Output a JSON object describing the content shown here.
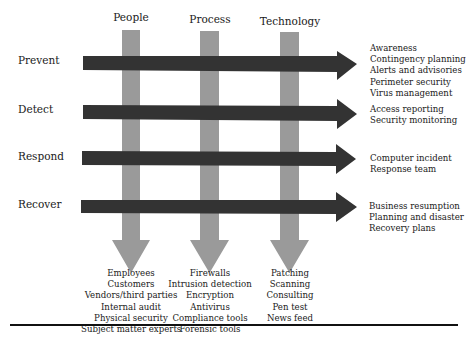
{
  "diagram": {
    "columns": [
      {
        "label": "People",
        "items": [
          "Employees",
          "Customers",
          "Vendors/third parties",
          "Internal audit",
          "Physical security",
          "Subject matter experts"
        ]
      },
      {
        "label": "Process",
        "items": [
          "Firewalls",
          "Intrusion detection",
          "Encryption",
          "Antivirus",
          "Compliance tools",
          "Forensic tools"
        ]
      },
      {
        "label": "Technology",
        "items": [
          "Patching",
          "Scanning",
          "Consulting",
          "Pen test",
          "News feed"
        ]
      }
    ],
    "rows": [
      {
        "label": "Prevent",
        "items": [
          "Awareness",
          "Contingency planning",
          "Alerts and advisories",
          "Perimeter security",
          "Virus management"
        ]
      },
      {
        "label": "Detect",
        "items": [
          "Access reporting",
          "Security monitoring"
        ]
      },
      {
        "label": "Respond",
        "items": [
          "Computer incident",
          "Response team"
        ]
      },
      {
        "label": "Recover",
        "items": [
          "Business resumption",
          "Planning and disaster",
          "Recovery plans"
        ]
      }
    ],
    "colors": {
      "vertical_arrow": "#9a9a9a",
      "horizontal_arrow": "#333333",
      "rule": "#111111"
    }
  }
}
